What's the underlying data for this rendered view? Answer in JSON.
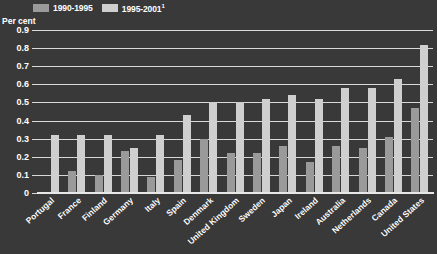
{
  "chart_data": {
    "type": "bar",
    "title": "",
    "xlabel": "",
    "ylabel": "Per cent",
    "ylim": [
      0,
      0.9
    ],
    "ytick_labels": [
      "0.9",
      "0.8",
      "0.7",
      "0.6",
      "0.5",
      "0.4",
      "0.3",
      "0.2",
      "0.1",
      "0"
    ],
    "ytick_values": [
      0.9,
      0.8,
      0.7,
      0.6,
      0.5,
      0.4,
      0.3,
      0.2,
      0.1,
      0
    ],
    "grid": true,
    "legend_position": "top-left",
    "categories": [
      "Portugal",
      "France",
      "Finland",
      "Germany",
      "Italy",
      "Spain",
      "Denmark",
      "United Kingdom",
      "Sweden",
      "Japan",
      "Ireland",
      "Australia",
      "Netherlands",
      "Canada",
      "United States"
    ],
    "series": [
      {
        "name": "1990-1995",
        "color": "#9a9a9a",
        "values": [
          0.0,
          0.12,
          0.1,
          0.23,
          0.09,
          0.18,
          0.3,
          0.22,
          0.22,
          0.26,
          0.17,
          0.26,
          0.25,
          0.31,
          0.47
        ]
      },
      {
        "name": "1995-2001",
        "color": "#cfcfcf",
        "values": [
          0.32,
          0.32,
          0.32,
          0.25,
          0.32,
          0.43,
          0.5,
          0.5,
          0.52,
          0.54,
          0.52,
          0.58,
          0.58,
          0.63,
          0.82
        ]
      }
    ]
  },
  "legend": {
    "items": [
      {
        "label": "1990-1995",
        "sup": "",
        "swatch": "#9a9a9a"
      },
      {
        "label": "1995-2001",
        "sup": "1",
        "swatch": "#cfcfcf"
      }
    ]
  },
  "axis": {
    "y_title": "Per cent"
  },
  "colors": {
    "background": "#393939",
    "gridline": "#d8d8d8",
    "text": "#ffffff",
    "series1": "#9a9a9a",
    "series2": "#cfcfcf"
  }
}
